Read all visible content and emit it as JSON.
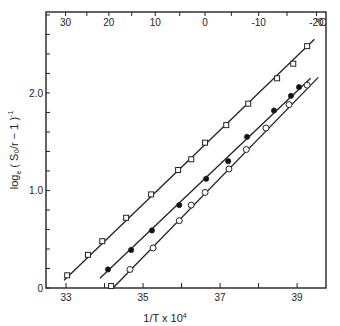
{
  "chart_data": {
    "type": "scatter",
    "title": "",
    "xlabel": "1/T x 10^4",
    "xlabel_display": {
      "main": "1/T x 10",
      "sup": "4"
    },
    "ylabel": "log_e (S0/r - 1)^-1",
    "ylabel_display": {
      "main": "log",
      "sub": "e",
      "rest": " ( S₀/r − 1 )",
      "sup": "-1"
    },
    "xlim": [
      32.48,
      39.75
    ],
    "ylim": [
      0,
      2.83
    ],
    "x_ticks": [
      33,
      34,
      35,
      36,
      37,
      38,
      39
    ],
    "x_tick_labels": [
      "33",
      "",
      "35",
      "",
      "37",
      "",
      "39"
    ],
    "y_ticks": [
      0,
      0.2,
      0.4,
      0.6,
      0.8,
      1.0,
      1.2,
      1.4,
      1.6,
      1.8,
      2.0,
      2.2,
      2.4,
      2.6,
      2.8
    ],
    "y_tick_labels": {
      "0": "0",
      "1.0": "1.0",
      "2.0": "2.0"
    },
    "top_axis": {
      "label_unit": "°C",
      "temperatures_c": [
        30,
        25,
        20,
        15,
        10,
        5,
        0,
        -5,
        -10,
        -15,
        -20
      ],
      "labels": {
        "30": "30",
        "20": "20",
        "10": "10",
        "0": "0",
        "-10": "-10",
        "-20": "-20"
      }
    },
    "grid": false,
    "legend": "none",
    "series": [
      {
        "name": "open squares",
        "marker": "square-open",
        "x": [
          33.03,
          33.57,
          33.94,
          34.56,
          35.21,
          35.91,
          36.25,
          36.61,
          37.16,
          37.73,
          38.48,
          38.9,
          39.26
        ],
        "y": [
          0.13,
          0.34,
          0.48,
          0.72,
          0.96,
          1.21,
          1.32,
          1.49,
          1.67,
          1.89,
          2.15,
          2.3,
          2.48
        ],
        "fit": {
          "x": [
            32.95,
            39.45
          ],
          "y": [
            0.08,
            2.55
          ]
        }
      },
      {
        "name": "filled circles",
        "marker": "circle-filled",
        "x": [
          34.09,
          34.69,
          35.23,
          35.94,
          36.64,
          37.21,
          37.7,
          38.4,
          38.84,
          39.05
        ],
        "y": [
          0.19,
          0.39,
          0.59,
          0.85,
          1.12,
          1.3,
          1.55,
          1.82,
          1.97,
          2.06
        ],
        "fit": {
          "x": [
            33.88,
            39.35
          ],
          "y": [
            0.1,
            2.15
          ]
        }
      },
      {
        "name": "open circles",
        "marker": "circle-open",
        "x": [
          34.66,
          35.26,
          35.94,
          36.25,
          36.61,
          37.23,
          37.68,
          38.19,
          38.79,
          39.26
        ],
        "y": [
          0.19,
          0.41,
          0.69,
          0.85,
          0.98,
          1.22,
          1.42,
          1.64,
          1.88,
          2.08
        ],
        "fit": {
          "x": [
            34.22,
            39.55
          ],
          "y": [
            0.0,
            2.16
          ]
        }
      },
      {
        "name": "open square at base",
        "marker": "square-open",
        "x": [
          34.17
        ],
        "y": [
          0.02
        ],
        "fit": null
      }
    ]
  }
}
